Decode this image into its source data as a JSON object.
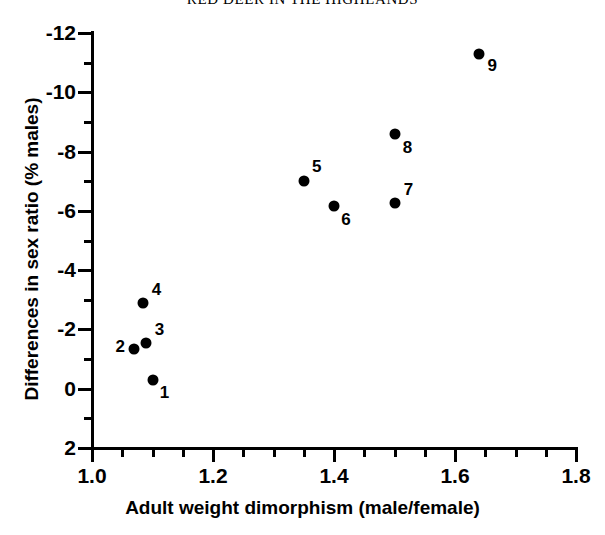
{
  "title": "RED DEER IN THE HIGHLANDS",
  "chart_data": {
    "type": "scatter",
    "title": "RED DEER IN THE HIGHLANDS",
    "xlabel": "Adult weight dimorphism (male/female)",
    "ylabel": "Differences in sex ratio (% males)",
    "xlim": [
      1.0,
      1.8
    ],
    "ylim": [
      2,
      -12
    ],
    "y_axis_inverted": true,
    "grid": false,
    "legend": null,
    "xticks": [
      "1.0",
      "1.2",
      "1.4",
      "1.6",
      "1.8"
    ],
    "xtick_values": [
      1.0,
      1.2,
      1.4,
      1.6,
      1.8
    ],
    "xminor_step": 0.05,
    "yticks": [
      "-12",
      "-10",
      "-8",
      "-6",
      "-4",
      "-2",
      "0",
      "2"
    ],
    "ytick_values": [
      -12,
      -10,
      -8,
      -6,
      -4,
      -2,
      0,
      2
    ],
    "yminor_step": 1,
    "marker": "filled-circle",
    "marker_color": "#000000",
    "points": [
      {
        "label": "1",
        "x": 1.1,
        "y": -0.3,
        "label_dx": 12,
        "label_dy": 13
      },
      {
        "label": "2",
        "x": 1.07,
        "y": -1.35,
        "label_dx": -14,
        "label_dy": -2
      },
      {
        "label": "3",
        "x": 1.09,
        "y": -1.55,
        "label_dx": 13,
        "label_dy": -13
      },
      {
        "label": "4",
        "x": 1.085,
        "y": -2.9,
        "label_dx": 13,
        "label_dy": -13
      },
      {
        "label": "5",
        "x": 1.35,
        "y": -7.0,
        "label_dx": 13,
        "label_dy": -14
      },
      {
        "label": "6",
        "x": 1.4,
        "y": -6.15,
        "label_dx": 12,
        "label_dy": 14
      },
      {
        "label": "7",
        "x": 1.5,
        "y": -6.25,
        "label_dx": 14,
        "label_dy": -13
      },
      {
        "label": "8",
        "x": 1.5,
        "y": -8.6,
        "label_dx": 13,
        "label_dy": 14
      },
      {
        "label": "9",
        "x": 1.64,
        "y": -11.3,
        "label_dx": 13,
        "label_dy": 12
      }
    ]
  }
}
